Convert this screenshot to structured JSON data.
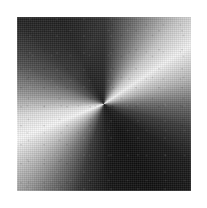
{
  "figure": {
    "background_color": "#ffffff",
    "canvas": {
      "width": 207,
      "height": 208
    },
    "square": {
      "x": 17,
      "y": 17,
      "width": 174,
      "height": 174,
      "center_x": 104,
      "center_y": 104
    },
    "layers": {
      "conic": "conic-gradient-layer",
      "sheen": "diagonal-sheen-layer",
      "dither": "halftone-dither-layer",
      "grain": "scan-grain-layer",
      "edge": "soft-edge-layer"
    }
  },
  "chart_data": {
    "type": "heatmap",
    "subtitle": "",
    "xlabel": "",
    "ylabel": "",
    "grid": false,
    "legend": "none",
    "colormap": "grayscale",
    "value_range": [
      0,
      255
    ],
    "center": [
      0.5,
      0.5
    ],
    "angle_stops_deg": [
      0,
      22,
      42,
      56,
      74,
      90,
      106,
      124,
      150,
      176,
      196,
      214,
      232,
      248,
      262,
      278,
      296,
      314,
      334,
      360
    ],
    "gray_values": [
      26,
      110,
      201,
      242,
      180,
      106,
      58,
      27,
      16,
      21,
      46,
      107,
      182,
      246,
      220,
      142,
      74,
      35,
      18,
      26
    ],
    "hex_stops": [
      "#1a1a1a",
      "#6e6e6e",
      "#c9c9c9",
      "#f2f2f2",
      "#b4b4b4",
      "#6a6a6a",
      "#3a3a3a",
      "#1b1b1b",
      "#101010",
      "#151515",
      "#2e2e2e",
      "#6b6b6b",
      "#b6b6b6",
      "#f6f6f6",
      "#dcdcdc",
      "#8e8e8e",
      "#4a4a4a",
      "#232323",
      "#121212",
      "#1a1a1a"
    ],
    "sectors": [
      {
        "name": "top-triangle",
        "corner_left_gray": 22,
        "corner_right_gray": 24,
        "mid_gray": 232,
        "note": "Dark at the upper-left corner, brightening to near-white about a third of the way across, then darkening again toward the upper-right corner."
      },
      {
        "name": "right-triangle",
        "corner_top_gray": 235,
        "corner_bottom_gray": 150,
        "mid_gray": 70,
        "note": "Bright just below the top-right corner, darkening to near-black at mid height, then lightening again toward the bottom-right corner."
      },
      {
        "name": "bottom-triangle",
        "corner_left_gray": 20,
        "corner_right_gray": 22,
        "mid_gray": 60,
        "note": "Dark overall; the darkest wedge of the figure, deepest just right of the center point."
      },
      {
        "name": "left-triangle",
        "corner_top_gray": 28,
        "corner_bottom_gray": 248,
        "mid_gray": 205,
        "note": "Dark near the top-left corner, brightening steadily downward to near-white at the bottom-left corner and at the tip touching the center."
      }
    ],
    "sampled_points": [
      {
        "label": "center",
        "x": 0.5,
        "y": 0.5,
        "gray": 170
      },
      {
        "label": "top-edge-left",
        "x": 0.1,
        "y": 0.02,
        "gray": 30
      },
      {
        "label": "top-edge-mid",
        "x": 0.4,
        "y": 0.02,
        "gray": 215
      },
      {
        "label": "top-edge-right",
        "x": 0.88,
        "y": 0.02,
        "gray": 40
      },
      {
        "label": "right-edge-top",
        "x": 0.98,
        "y": 0.14,
        "gray": 225
      },
      {
        "label": "right-edge-mid",
        "x": 0.98,
        "y": 0.55,
        "gray": 60
      },
      {
        "label": "right-edge-bottom",
        "x": 0.98,
        "y": 0.92,
        "gray": 150
      },
      {
        "label": "bottom-edge-left",
        "x": 0.12,
        "y": 0.98,
        "gray": 32
      },
      {
        "label": "bottom-edge-mid",
        "x": 0.5,
        "y": 0.98,
        "gray": 55
      },
      {
        "label": "bottom-edge-right",
        "x": 0.9,
        "y": 0.98,
        "gray": 28
      },
      {
        "label": "left-edge-top",
        "x": 0.02,
        "y": 0.1,
        "gray": 35
      },
      {
        "label": "left-edge-mid",
        "x": 0.02,
        "y": 0.52,
        "gray": 165
      },
      {
        "label": "left-edge-bottom",
        "x": 0.02,
        "y": 0.9,
        "gray": 245
      }
    ]
  }
}
